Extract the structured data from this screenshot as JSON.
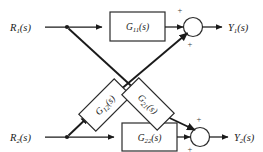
{
  "diagram": {
    "type": "control-block-diagram",
    "background_color": "#ffffff",
    "line_color": "#1a1a1a",
    "inputs": [
      {
        "id": "r1",
        "label": "R",
        "subscript": "1",
        "suffix": "(s)"
      },
      {
        "id": "r2",
        "label": "R",
        "subscript": "2",
        "suffix": "(s)"
      }
    ],
    "outputs": [
      {
        "id": "y1",
        "label": "Y",
        "subscript": "1",
        "suffix": "(s)"
      },
      {
        "id": "y2",
        "label": "Y",
        "subscript": "2",
        "suffix": "(s)"
      }
    ],
    "blocks": [
      {
        "id": "g11",
        "label": "G",
        "subscript": "11",
        "suffix": "(s)",
        "orientation": "horizontal",
        "rotation_deg": 0
      },
      {
        "id": "g12",
        "label": "G",
        "subscript": "12",
        "suffix": "(s)",
        "orientation": "rotated",
        "rotation_deg": -45
      },
      {
        "id": "g21",
        "label": "G",
        "subscript": "21",
        "suffix": "(s)",
        "orientation": "rotated",
        "rotation_deg": 45
      },
      {
        "id": "g22",
        "label": "G",
        "subscript": "22",
        "suffix": "(s)",
        "orientation": "horizontal",
        "rotation_deg": 0
      }
    ],
    "summing_junctions": [
      {
        "id": "sum1",
        "signs": [
          {
            "id": "sum1-plus-top",
            "symbol": "+"
          },
          {
            "id": "sum1-plus-bottom",
            "symbol": "+"
          }
        ]
      },
      {
        "id": "sum2",
        "signs": [
          {
            "id": "sum2-plus-top",
            "symbol": "+"
          },
          {
            "id": "sum2-plus-bottom",
            "symbol": "+"
          }
        ]
      }
    ],
    "junction_dots": [
      {
        "id": "tap-r1"
      },
      {
        "id": "tap-r2"
      }
    ]
  }
}
